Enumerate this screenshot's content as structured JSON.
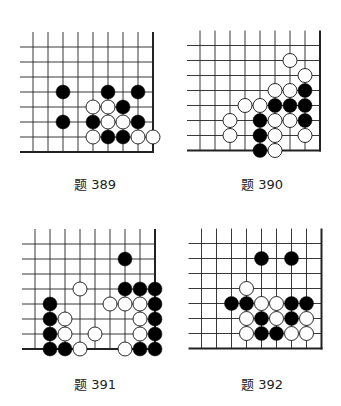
{
  "page": {
    "background": "#ffffff",
    "line_color": "#222222",
    "black_stone": "#000000",
    "white_stone": "#ffffff"
  },
  "problems": [
    {
      "id": "389",
      "caption": "题 389",
      "origin": [
        33,
        47
      ],
      "caption_pos": [
        45,
        177
      ],
      "stones": [
        {
          "c": 2,
          "r": 3,
          "color": "black"
        },
        {
          "c": 5,
          "r": 3,
          "color": "black"
        },
        {
          "c": 7,
          "r": 3,
          "color": "black"
        },
        {
          "c": 4,
          "r": 4,
          "color": "white"
        },
        {
          "c": 5,
          "r": 4,
          "color": "white"
        },
        {
          "c": 6,
          "r": 4,
          "color": "black"
        },
        {
          "c": 2,
          "r": 5,
          "color": "black"
        },
        {
          "c": 4,
          "r": 5,
          "color": "black"
        },
        {
          "c": 5,
          "r": 5,
          "color": "white"
        },
        {
          "c": 6,
          "r": 5,
          "color": "white"
        },
        {
          "c": 7,
          "r": 5,
          "color": "black"
        },
        {
          "c": 4,
          "r": 6,
          "color": "white"
        },
        {
          "c": 5,
          "r": 6,
          "color": "black"
        },
        {
          "c": 6,
          "r": 6,
          "color": "black"
        },
        {
          "c": 7,
          "r": 6,
          "color": "white"
        },
        {
          "c": 8,
          "r": 6,
          "color": "white"
        }
      ]
    },
    {
      "id": "390",
      "caption": "题 390",
      "origin": [
        200,
        45.5
      ],
      "caption_pos": [
        212,
        177
      ],
      "stones": [
        {
          "c": 6,
          "r": 1,
          "color": "white"
        },
        {
          "c": 7,
          "r": 2,
          "color": "white"
        },
        {
          "c": 5,
          "r": 3,
          "color": "white"
        },
        {
          "c": 6,
          "r": 3,
          "color": "white"
        },
        {
          "c": 7,
          "r": 3,
          "color": "black"
        },
        {
          "c": 3,
          "r": 4,
          "color": "white"
        },
        {
          "c": 4,
          "r": 4,
          "color": "white"
        },
        {
          "c": 5,
          "r": 4,
          "color": "black"
        },
        {
          "c": 6,
          "r": 4,
          "color": "black"
        },
        {
          "c": 7,
          "r": 4,
          "color": "black"
        },
        {
          "c": 2,
          "r": 5,
          "color": "white"
        },
        {
          "c": 4,
          "r": 5,
          "color": "black"
        },
        {
          "c": 5,
          "r": 5,
          "color": "white"
        },
        {
          "c": 6,
          "r": 5,
          "color": "white"
        },
        {
          "c": 7,
          "r": 5,
          "color": "black"
        },
        {
          "c": 2,
          "r": 6,
          "color": "white"
        },
        {
          "c": 4,
          "r": 6,
          "color": "black"
        },
        {
          "c": 5,
          "r": 6,
          "color": "white"
        },
        {
          "c": 7,
          "r": 6,
          "color": "white"
        },
        {
          "c": 4,
          "r": 7,
          "color": "black"
        },
        {
          "c": 5,
          "r": 7,
          "color": "white"
        }
      ]
    },
    {
      "id": "391",
      "caption": "题 391",
      "origin": [
        35,
        244
      ],
      "caption_pos": [
        45,
        377
      ],
      "stones": [
        {
          "c": 6,
          "r": 1,
          "color": "black"
        },
        {
          "c": 3,
          "r": 3,
          "color": "white"
        },
        {
          "c": 6,
          "r": 3,
          "color": "black"
        },
        {
          "c": 7,
          "r": 3,
          "color": "black"
        },
        {
          "c": 8,
          "r": 3,
          "color": "black"
        },
        {
          "c": 1,
          "r": 4,
          "color": "black"
        },
        {
          "c": 5,
          "r": 4,
          "color": "white"
        },
        {
          "c": 6,
          "r": 4,
          "color": "white"
        },
        {
          "c": 7,
          "r": 4,
          "color": "white"
        },
        {
          "c": 8,
          "r": 4,
          "color": "black"
        },
        {
          "c": 1,
          "r": 5,
          "color": "black"
        },
        {
          "c": 2,
          "r": 5,
          "color": "white"
        },
        {
          "c": 7,
          "r": 5,
          "color": "white"
        },
        {
          "c": 8,
          "r": 5,
          "color": "black"
        },
        {
          "c": 1,
          "r": 6,
          "color": "black"
        },
        {
          "c": 2,
          "r": 6,
          "color": "white"
        },
        {
          "c": 4,
          "r": 6,
          "color": "white"
        },
        {
          "c": 7,
          "r": 6,
          "color": "white"
        },
        {
          "c": 8,
          "r": 6,
          "color": "black"
        },
        {
          "c": 1,
          "r": 7,
          "color": "black"
        },
        {
          "c": 2,
          "r": 7,
          "color": "black"
        },
        {
          "c": 3,
          "r": 7,
          "color": "white"
        },
        {
          "c": 6,
          "r": 7,
          "color": "white"
        },
        {
          "c": 7,
          "r": 7,
          "color": "black"
        },
        {
          "c": 8,
          "r": 7,
          "color": "black"
        }
      ]
    },
    {
      "id": "392",
      "caption": "题 392",
      "origin": [
        201.5,
        243.5
      ],
      "caption_pos": [
        212,
        377
      ],
      "stones": [
        {
          "c": 4,
          "r": 1,
          "color": "black"
        },
        {
          "c": 6,
          "r": 1,
          "color": "black"
        },
        {
          "c": 3,
          "r": 3,
          "color": "white"
        },
        {
          "c": 2,
          "r": 4,
          "color": "black"
        },
        {
          "c": 3,
          "r": 4,
          "color": "black"
        },
        {
          "c": 4,
          "r": 4,
          "color": "white"
        },
        {
          "c": 5,
          "r": 4,
          "color": "white"
        },
        {
          "c": 6,
          "r": 4,
          "color": "black"
        },
        {
          "c": 7,
          "r": 4,
          "color": "black"
        },
        {
          "c": 3,
          "r": 5,
          "color": "white"
        },
        {
          "c": 4,
          "r": 5,
          "color": "black"
        },
        {
          "c": 5,
          "r": 5,
          "color": "white"
        },
        {
          "c": 6,
          "r": 5,
          "color": "black"
        },
        {
          "c": 7,
          "r": 5,
          "color": "white"
        },
        {
          "c": 3,
          "r": 6,
          "color": "white"
        },
        {
          "c": 4,
          "r": 6,
          "color": "black"
        },
        {
          "c": 5,
          "r": 6,
          "color": "black"
        },
        {
          "c": 6,
          "r": 6,
          "color": "white"
        },
        {
          "c": 7,
          "r": 6,
          "color": "white"
        }
      ]
    }
  ]
}
